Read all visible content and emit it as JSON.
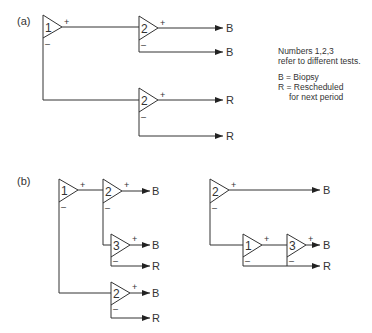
{
  "panels": {
    "a": {
      "label": "(a)"
    },
    "b": {
      "label": "(b)"
    }
  },
  "signs": {
    "plus": "+",
    "minus": "–"
  },
  "outcomes": {
    "biopsy": "B",
    "rescheduled": "R"
  },
  "tests": {
    "t1": "1",
    "t2": "2",
    "t3": "3"
  },
  "legend": {
    "line1": "Numbers 1,2,3",
    "line2": "refer to different tests.",
    "line3": "B = Biopsy",
    "line4": "R = Rescheduled",
    "line5": "for next period"
  },
  "colors": {
    "ink": "#333333",
    "background": "#ffffff"
  }
}
